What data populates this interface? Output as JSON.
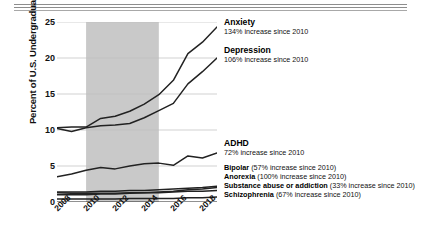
{
  "header": {
    "rules": 3
  },
  "chart_data": {
    "type": "line",
    "title": "",
    "xlabel": "",
    "ylabel": "Percent of U.S. Undergraduates",
    "xlim": [
      2008,
      2019
    ],
    "ylim": [
      0,
      25
    ],
    "yticks": [
      0,
      5,
      10,
      15,
      20,
      25
    ],
    "xticks": [
      2008,
      2010,
      2012,
      2014,
      2016,
      2018
    ],
    "grid": "horizontal",
    "legend_position": "inline-right",
    "shaded_region": {
      "label": "",
      "x_start": 2010,
      "x_end": 2015,
      "color": "#c9c9c9"
    },
    "x": [
      2008,
      2009,
      2010,
      2011,
      2012,
      2013,
      2014,
      2015,
      2016,
      2017,
      2018,
      2019
    ],
    "series": [
      {
        "name": "Anxiety",
        "color": "#222222",
        "values": [
          10.3,
          10.4,
          10.4,
          11.6,
          11.9,
          12.6,
          13.6,
          14.9,
          16.9,
          20.6,
          22.2,
          24.3
        ]
      },
      {
        "name": "Depression",
        "color": "#222222",
        "values": [
          10.2,
          9.8,
          10.3,
          10.6,
          10.7,
          10.9,
          11.7,
          12.7,
          13.7,
          16.4,
          18.1,
          20.0
        ]
      },
      {
        "name": "ADHD",
        "color": "#222222",
        "values": [
          3.5,
          3.9,
          4.4,
          4.8,
          4.6,
          5.0,
          5.3,
          5.4,
          5.1,
          6.4,
          6.1,
          6.8
        ]
      },
      {
        "name": "Bipolar",
        "color": "#222222",
        "values": [
          1.4,
          1.4,
          1.4,
          1.5,
          1.5,
          1.6,
          1.6,
          1.7,
          1.8,
          1.9,
          2.0,
          2.2
        ]
      },
      {
        "name": "Anorexia",
        "color": "#222222",
        "values": [
          1.0,
          1.0,
          1.0,
          1.1,
          1.1,
          1.2,
          1.3,
          1.4,
          1.5,
          1.7,
          1.8,
          2.0
        ]
      },
      {
        "name": "Substance abuse or addiction",
        "color": "#222222",
        "values": [
          1.3,
          1.2,
          1.2,
          1.2,
          1.2,
          1.3,
          1.3,
          1.3,
          1.4,
          1.5,
          1.5,
          1.6
        ]
      },
      {
        "name": "Schizophrenia",
        "color": "#222222",
        "values": [
          0.4,
          0.4,
          0.4,
          0.4,
          0.4,
          0.5,
          0.5,
          0.5,
          0.5,
          0.6,
          0.6,
          0.7
        ]
      }
    ],
    "annotations": [
      {
        "title": "Anxiety",
        "detail": "134% increase since 2010"
      },
      {
        "title": "Depression",
        "detail": "106% increase since 2010"
      },
      {
        "title": "ADHD",
        "detail": "72% increase since 2010"
      },
      {
        "title": "Bipolar",
        "detail": "(57% increase since 2010)"
      },
      {
        "title": "Anorexia",
        "detail": "(100% increase since 2010)"
      },
      {
        "title": "Substance abuse or addiction",
        "detail": "(33% increase since 2010)"
      },
      {
        "title": "Schizophrenia",
        "detail": "(67% increase since 2010)"
      }
    ]
  },
  "axis": {
    "y": {
      "t0": "25",
      "t1": "20",
      "t2": "15",
      "t3": "10",
      "t4": "5",
      "t5": "0"
    },
    "x": {
      "t0": "2008",
      "t1": "2010",
      "t2": "2012",
      "t3": "2014",
      "t4": "2016",
      "t5": "2018"
    },
    "ylabel": "Percent of U.S. Undergraduates"
  }
}
